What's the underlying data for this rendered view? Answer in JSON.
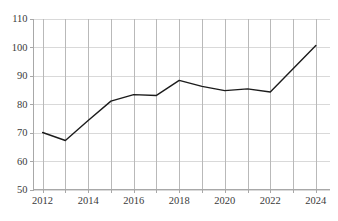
{
  "chart_data": {
    "type": "line",
    "title": "",
    "subtitle": "",
    "xlabel": "",
    "ylabel": "",
    "x": [
      2012,
      2013,
      2014,
      2015,
      2016,
      2017,
      2018,
      2019,
      2020,
      2021,
      2022,
      2023,
      2024
    ],
    "series": [
      {
        "name": "",
        "values": [
          70.0,
          67.2,
          74.2,
          81.0,
          83.3,
          83.0,
          88.3,
          86.2,
          84.7,
          85.3,
          84.2,
          92.4,
          100.5
        ]
      }
    ],
    "xlim": [
      2011.6,
      2024.6
    ],
    "ylim": [
      50,
      110
    ],
    "yticks": [
      50,
      60,
      70,
      80,
      90,
      100,
      110
    ],
    "ytick_labels": [
      "50",
      "60",
      "70",
      "80",
      "90",
      "100",
      "110"
    ],
    "xticks": [
      2012,
      2013,
      2014,
      2015,
      2016,
      2017,
      2018,
      2019,
      2020,
      2021,
      2022,
      2023,
      2024
    ],
    "xtick_labels_shown": [
      "2012",
      "2014",
      "2016",
      "2018",
      "2020",
      "2022",
      "2024"
    ],
    "xtick_label_values": [
      2012,
      2014,
      2016,
      2018,
      2020,
      2022,
      2024
    ],
    "grid": {
      "horizontal": true,
      "vertical": true,
      "horizontal_color": "#d9d9d9",
      "vertical_color": "#b9b9b9"
    },
    "legend": {
      "visible": false,
      "position": "none",
      "entries": []
    },
    "line_color": "#1c1c1c",
    "background_color": "#ffffff",
    "annotations": [],
    "markers": false
  },
  "axes": {
    "y_axis_name": "y-axis",
    "x_axis_name": "x-axis"
  }
}
